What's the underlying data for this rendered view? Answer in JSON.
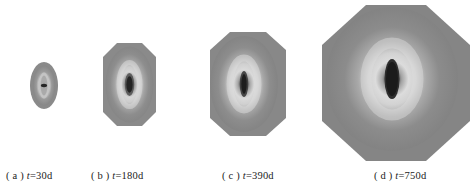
{
  "figure": {
    "background_color": "#ffffff",
    "panel_count": 4,
    "caption_prefix_open": "( ",
    "caption_prefix_close": " ) ",
    "time_variable": "t",
    "equals": "=",
    "unit": "d"
  },
  "panels": [
    {
      "id": "a",
      "label_letter": "a",
      "caption_open": "( ",
      "caption_close": " ) ",
      "time_var": "t",
      "time_text": "=30d",
      "caption_full": "( a ) t=30d",
      "time_value": 30,
      "time_unit": "d",
      "shape": "ellipse",
      "width_px": 28,
      "height_px": 47,
      "left_px": 30,
      "top_px": 62,
      "body_color": "#8a8a8a",
      "ring_color": "#c9c9c9",
      "core_color": "#2e2e2e"
    },
    {
      "id": "b",
      "label_letter": "b",
      "caption_open": "( ",
      "caption_close": " ) ",
      "time_var": "t",
      "time_text": "=180d",
      "caption_full": "( b ) t=180d",
      "time_value": 180,
      "time_unit": "d",
      "shape": "ellipse",
      "width_px": 53,
      "height_px": 83,
      "left_px": 103,
      "top_px": 43,
      "body_color": "#8a8a8a",
      "ring_color": "#d2d2d2",
      "core_color": "#2b2b2b"
    },
    {
      "id": "c",
      "label_letter": "c",
      "caption_open": "( ",
      "caption_close": " ) ",
      "time_var": "t",
      "time_text": "=390d",
      "caption_full": "( c ) t=390d",
      "time_value": 390,
      "time_unit": "d",
      "shape": "ellipse",
      "width_px": 76,
      "height_px": 104,
      "left_px": 210,
      "top_px": 32,
      "body_color": "#888888",
      "ring_color": "#d6d6d6",
      "core_color": "#232323"
    },
    {
      "id": "d",
      "label_letter": "d",
      "caption_open": "( ",
      "caption_close": " ) ",
      "time_var": "t",
      "time_text": "=750d",
      "caption_full": "( d ) t=750d",
      "time_value": 750,
      "time_unit": "d",
      "shape": "octagon",
      "width_px": 148,
      "height_px": 156,
      "left_px": 322,
      "top_px": 5,
      "body_color": "#858585",
      "ring_color": "#d8d8d8",
      "core_color": "#1f1f1f"
    }
  ]
}
